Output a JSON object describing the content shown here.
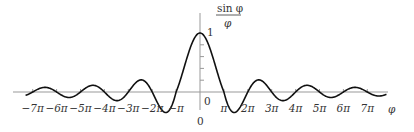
{
  "chart_data": {
    "type": "line",
    "title": "",
    "function": "sin(phi)/phi",
    "ylabel": {
      "numerator": "sin φ",
      "denominator": "φ"
    },
    "xlabel": "φ",
    "x_ticks": [
      -7,
      -6,
      -5,
      -4,
      -3,
      -2,
      -1,
      1,
      2,
      3,
      4,
      5,
      6,
      7
    ],
    "x_tick_labels": [
      "−7π",
      "−6π",
      "−5π",
      "−4π",
      "−3π",
      "−2π",
      "−π",
      "π",
      "2π",
      "3π",
      "4π",
      "5π",
      "6π",
      "7π"
    ],
    "x_unit": "pi",
    "xlim": [
      -8.1,
      8.2
    ],
    "ylim": [
      -0.25,
      1.3
    ],
    "y_tick_labels": {
      "one": "1",
      "origin_right": "0",
      "origin_below": "0"
    },
    "y_minor_ticks": [
      0.2,
      0.4,
      0.6,
      0.8
    ],
    "grid": false,
    "legend": null,
    "peak": {
      "x": 0,
      "y": 1
    },
    "series": [
      {
        "name": "sin φ / φ",
        "x_range_pi": [
          -7.3,
          7.8
        ]
      }
    ]
  },
  "colors": {
    "axis": "#999999",
    "curve": "#111111",
    "text": "#333333"
  }
}
